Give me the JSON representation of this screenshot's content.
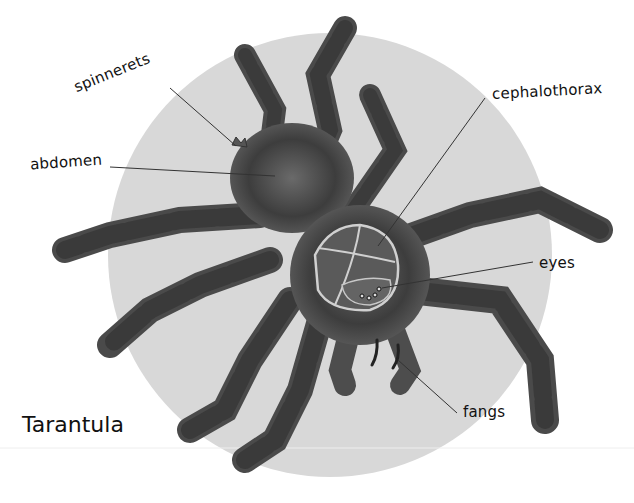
{
  "diagram": {
    "title": "Tarantula",
    "background_circle_color": "#d9d9d9",
    "labels": [
      {
        "id": "spinnerets",
        "text": "spinnerets"
      },
      {
        "id": "abdomen",
        "text": "abdomen"
      },
      {
        "id": "cephalothorax",
        "text": "cephalothorax"
      },
      {
        "id": "eyes",
        "text": "eyes"
      },
      {
        "id": "fangs",
        "text": "fangs"
      }
    ]
  }
}
